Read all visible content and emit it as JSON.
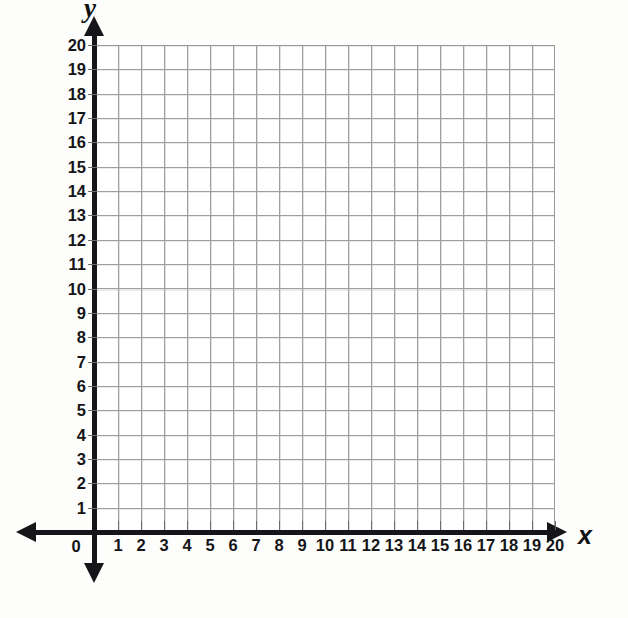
{
  "figure": {
    "type": "blank-coordinate-grid",
    "title": ""
  },
  "axes": {
    "x": {
      "name": "x",
      "min": 0,
      "max": 20,
      "step": 1,
      "arrow_left": "arrow-left",
      "arrow_right": "arrow-right",
      "tick_labels": [
        "1",
        "2",
        "3",
        "4",
        "5",
        "6",
        "7",
        "8",
        "9",
        "10",
        "11",
        "12",
        "13",
        "14",
        "15",
        "16",
        "17",
        "18",
        "19",
        "20"
      ]
    },
    "y": {
      "name": "y",
      "min": 0,
      "max": 20,
      "step": 1,
      "arrow_up": "arrow-up",
      "arrow_down": "arrow-down",
      "tick_labels": [
        "1",
        "2",
        "3",
        "4",
        "5",
        "6",
        "7",
        "8",
        "9",
        "10",
        "11",
        "12",
        "13",
        "14",
        "15",
        "16",
        "17",
        "18",
        "19",
        "20"
      ]
    },
    "origin_label": "0"
  },
  "grid": {
    "columns": 20,
    "rows": 20,
    "line_color": "#9a9a9a",
    "fill_color": "#ffffff",
    "axis_color": "#16161a",
    "visible": true
  },
  "chart_data": {
    "type": "scatter",
    "title": "",
    "xlabel": "x",
    "ylabel": "y",
    "xlim": [
      0,
      20
    ],
    "ylim": [
      0,
      20
    ],
    "xticks": [
      0,
      1,
      2,
      3,
      4,
      5,
      6,
      7,
      8,
      9,
      10,
      11,
      12,
      13,
      14,
      15,
      16,
      17,
      18,
      19,
      20
    ],
    "yticks": [
      0,
      1,
      2,
      3,
      4,
      5,
      6,
      7,
      8,
      9,
      10,
      11,
      12,
      13,
      14,
      15,
      16,
      17,
      18,
      19,
      20
    ],
    "grid": true,
    "legend": null,
    "series": [],
    "x": [],
    "y": [],
    "annotations": []
  },
  "artifacts": {
    "bleed_through": [
      "",
      "",
      "",
      "",
      ""
    ]
  }
}
